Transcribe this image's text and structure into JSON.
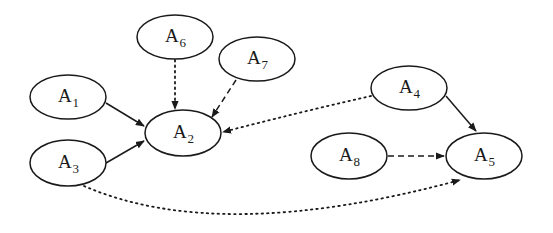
{
  "diagram": {
    "type": "directed-graph",
    "colors": {
      "stroke": "#1a1a1a",
      "background": "#ffffff"
    },
    "nodes": [
      {
        "id": "A1",
        "base": "A",
        "sub": "1",
        "cx": 68,
        "cy": 97,
        "rx": 38,
        "ry": 22
      },
      {
        "id": "A2",
        "base": "A",
        "sub": "2",
        "cx": 183,
        "cy": 133,
        "rx": 38,
        "ry": 23
      },
      {
        "id": "A3",
        "base": "A",
        "sub": "3",
        "cx": 68,
        "cy": 163,
        "rx": 38,
        "ry": 23
      },
      {
        "id": "A4",
        "base": "A",
        "sub": "4",
        "cx": 409,
        "cy": 88,
        "rx": 38,
        "ry": 22
      },
      {
        "id": "A5",
        "base": "A",
        "sub": "5",
        "cx": 484,
        "cy": 156,
        "rx": 38,
        "ry": 23
      },
      {
        "id": "A6",
        "base": "A",
        "sub": "6",
        "cx": 175,
        "cy": 37,
        "rx": 38,
        "ry": 22
      },
      {
        "id": "A7",
        "base": "A",
        "sub": "7",
        "cx": 257,
        "cy": 59,
        "rx": 38,
        "ry": 22
      },
      {
        "id": "A8",
        "base": "A",
        "sub": "8",
        "cx": 349,
        "cy": 156,
        "rx": 38,
        "ry": 23
      }
    ],
    "edges": [
      {
        "from": "A1",
        "to": "A2",
        "style": "solid",
        "path": "M106,103 L144,126"
      },
      {
        "from": "A3",
        "to": "A2",
        "style": "solid",
        "path": "M106,163 L144,141"
      },
      {
        "from": "A6",
        "to": "A2",
        "style": "dotted",
        "path": "M175,60 L175,109"
      },
      {
        "from": "A7",
        "to": "A2",
        "style": "dashed",
        "path": "M236,80 L212,117"
      },
      {
        "from": "A4",
        "to": "A2",
        "style": "dotted",
        "path": "M371,96 Q300,112 223,132"
      },
      {
        "from": "A4",
        "to": "A5",
        "style": "solid",
        "path": "M446,96 L476,131"
      },
      {
        "from": "A8",
        "to": "A5",
        "style": "dashed",
        "path": "M388,156 L444,156"
      },
      {
        "from": "A3",
        "to": "A5",
        "style": "dotted",
        "path": "M84,186 Q220,245 460,180"
      }
    ]
  }
}
